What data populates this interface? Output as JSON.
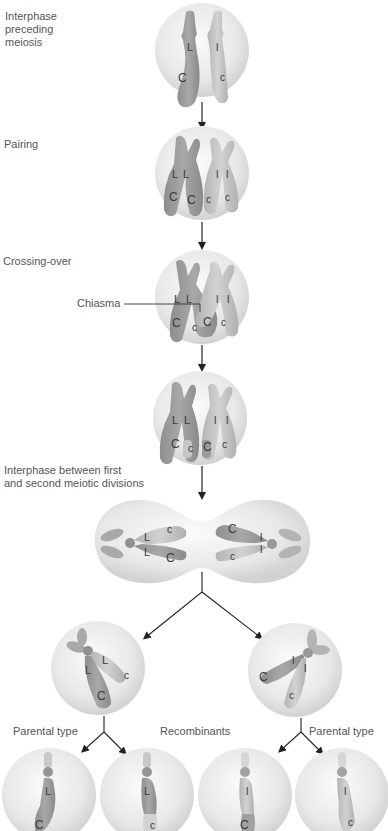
{
  "stages": [
    {
      "id": "interphase",
      "label": "Interphase\npreceding\nmeiosis"
    },
    {
      "id": "pairing",
      "label": "Pairing"
    },
    {
      "id": "crossing-over",
      "label": "Crossing-over"
    },
    {
      "id": "post-crossover",
      "label": ""
    },
    {
      "id": "interphase-between",
      "label": "Interphase between first\nand second meiotic divisions"
    }
  ],
  "annotations": {
    "chiasma": "Chiasma"
  },
  "outcomes": {
    "left": "Parental type",
    "middle": "Recombinants",
    "right": "Parental type"
  },
  "alleles": {
    "dominant_l": "L",
    "recessive_l": "l",
    "dominant_c": "C",
    "recessive_c": "c"
  },
  "gametes": [
    {
      "top": "L",
      "bottom": "C",
      "type": "Parental type"
    },
    {
      "top": "L",
      "bottom": "c",
      "type": "Recombinant"
    },
    {
      "top": "l",
      "bottom": "C",
      "type": "Recombinant"
    },
    {
      "top": "l",
      "bottom": "c",
      "type": "Parental type"
    }
  ],
  "colors": {
    "cell": "#e6e6e6",
    "chromosome_dark": "#9a9a9a",
    "chromosome_light": "#c4c4c4",
    "arrow": "#222222"
  }
}
